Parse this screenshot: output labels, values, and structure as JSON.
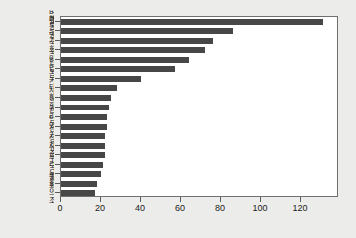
{
  "chart_data": {
    "type": "bar",
    "orientation": "horizontal",
    "title": "",
    "subtitle": "",
    "xlabel": "",
    "ylabel": "",
    "xlim": [
      0,
      139
    ],
    "ylim": null,
    "grid": false,
    "legend": null,
    "bar_color": "#474747",
    "plot_background": "#ffffff",
    "figure_background": "#ececeb",
    "axis_color": "#6f6f6f",
    "xticks": [
      0,
      20,
      40,
      60,
      80,
      100,
      120
    ],
    "xticklabels": [
      "0",
      "20",
      "40",
      "60",
      "80",
      "100",
      "120"
    ],
    "categories": [
      "법률",
      "대통령",
      "국가",
      "국회",
      "국민",
      "헌법",
      "보부",
      "기타",
      "사항",
      "의원",
      "권리",
      "임명",
      "선거",
      "정자",
      "유출",
      "무리",
      "국무",
      "원회",
      "국회의조"
    ],
    "values": [
      131,
      86,
      76,
      72,
      64,
      57,
      40,
      28,
      25,
      24,
      23,
      23,
      22,
      22,
      22,
      21,
      20,
      18,
      17
    ],
    "n_bars": 19
  }
}
